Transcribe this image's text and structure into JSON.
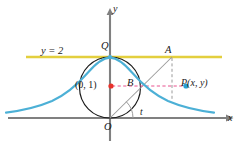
{
  "figure": {
    "background_color": "#ffffff"
  },
  "axes": {
    "x_label": "x",
    "y_label": "y",
    "color": "#808080",
    "origin_label": "O",
    "x_axis_y": 118,
    "y_axis_x": 110
  },
  "tangent_line": {
    "label": "y = 2",
    "color": "#e3cf3e",
    "y_value": 2,
    "pixel_y": 57
  },
  "curve": {
    "name": "witch-of-agnesi",
    "color": "#4cb0d6",
    "equation_hint": "y = 8 / (x^2 + 4)"
  },
  "circle": {
    "center_label": "(0, 1)",
    "center_dot_color": "#e8322a",
    "stroke_color": "#1a1a1a",
    "radius_px": 30.5,
    "center_px": {
      "x": 110,
      "y": 87.5
    }
  },
  "points": {
    "Q": {
      "label": "Q",
      "x": 110,
      "y": 57,
      "color": "#4cb0d6"
    },
    "A": {
      "label": "A",
      "x": 172,
      "y": 57,
      "color": "#808080"
    },
    "B": {
      "label": "B",
      "x": 136,
      "y": 86,
      "color": "#808080"
    },
    "P": {
      "label": "P(x, y)",
      "x": 186,
      "y": 86,
      "color": "#2a9fd4"
    },
    "O": {
      "label": "O",
      "x": 110,
      "y": 118
    }
  },
  "angle": {
    "label": "t",
    "vertex": "O",
    "arc_color": "#808080"
  },
  "guides": {
    "horizontal_dash_color": "#e8528f",
    "vertical_dash_color": "#9a9a9a",
    "ray_color": "#9a9a9a"
  },
  "colors": {
    "accent_blue": "#4cb0d6",
    "accent_yellow": "#e3cf3e",
    "accent_red": "#e8322a",
    "accent_pink": "#e8528f",
    "gray": "#808080",
    "black": "#1a1a1a"
  }
}
